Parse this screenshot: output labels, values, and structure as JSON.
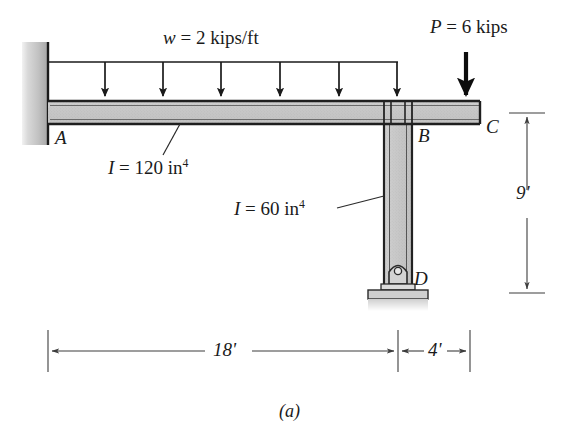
{
  "figure": {
    "caption": "(a)",
    "type": "structural-frame-diagram"
  },
  "loads": {
    "distributed": {
      "label_w": "w",
      "label_eq": " = 2 kips/ft",
      "magnitude": 2,
      "units": "kips/ft",
      "arrow_count": 6,
      "applied_from": "A",
      "applied_to": "B"
    },
    "point": {
      "label_p": "P",
      "label_eq": " = 6 kips",
      "magnitude": 6,
      "units": "kips",
      "applied_at": "C",
      "direction": "down"
    }
  },
  "joints": {
    "a": "A",
    "b": "B",
    "c": "C",
    "d": "D"
  },
  "members": {
    "beam": {
      "inertia_label_i": "I",
      "inertia_label_value": " = 120 in",
      "inertia_exponent": "4",
      "inertia": 120,
      "units": "in^4"
    },
    "column": {
      "inertia_label_i": "I",
      "inertia_label_value": " = 60 in",
      "inertia_exponent": "4",
      "inertia": 60,
      "units": "in^4"
    }
  },
  "dimensions": {
    "span_ab": "18'",
    "span_bc": "4'",
    "height_bd": "9'"
  },
  "colors": {
    "ink": "#1a1a1a",
    "member_fill": "#c9c9c9",
    "member_edge": "#222222",
    "wall_light": "#e8e8e8",
    "wall_dark": "#a8a8a8",
    "dim_line": "#4a4a4a",
    "ground": "#d5d5d5"
  }
}
